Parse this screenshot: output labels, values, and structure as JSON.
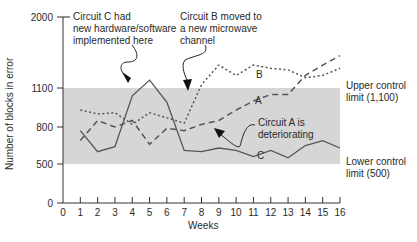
{
  "chart_data": {
    "type": "line",
    "title": "",
    "xlabel": "Weeks",
    "ylabel": "Number of blocks in error",
    "x": [
      1,
      2,
      3,
      4,
      5,
      6,
      7,
      8,
      9,
      10,
      11,
      12,
      13,
      14,
      15,
      16
    ],
    "x_ticks": [
      0,
      1,
      2,
      3,
      4,
      5,
      6,
      7,
      8,
      9,
      10,
      11,
      12,
      13,
      14,
      15,
      16
    ],
    "y_ticks": [
      0,
      500,
      800,
      1100,
      2000
    ],
    "ylim": [
      0,
      2000
    ],
    "xlim": [
      0,
      16
    ],
    "grid": false,
    "series": [
      {
        "name": "C",
        "style": "solid",
        "values": [
          770,
          600,
          640,
          1040,
          1200,
          990,
          610,
          600,
          630,
          610,
          560,
          610,
          550,
          650,
          690,
          630
        ]
      },
      {
        "name": "B",
        "style": "dotted",
        "values": [
          930,
          900,
          910,
          820,
          910,
          870,
          830,
          1140,
          1390,
          1260,
          1390,
          1350,
          1330,
          1230,
          1260,
          1350
        ]
      },
      {
        "name": "A",
        "style": "dashed",
        "values": [
          690,
          850,
          800,
          850,
          660,
          790,
          770,
          820,
          850,
          930,
          1000,
          1050,
          1050,
          1260,
          1390,
          1510
        ]
      }
    ],
    "control_band": {
      "upper": 1100,
      "lower": 500,
      "fill": "#d6d6d6"
    },
    "annotations": [
      {
        "text": "Circuit C had new hardware/software implemented here",
        "arrow_to": {
          "x": 4.6,
          "y": 1130
        }
      },
      {
        "text": "Circuit B moved to a new microwave channel",
        "arrow_to": {
          "x": 7.2,
          "y": 1040
        }
      },
      {
        "text": "Circuit A is deteriorating",
        "arrow_to": {
          "x": 9.0,
          "y": 860
        }
      },
      {
        "text": "Upper control limit (1,100)"
      },
      {
        "text": "Lower control limit (500)"
      }
    ]
  },
  "labels": {
    "ylabel": "Number of blocks in error",
    "xlabel": "Weeks",
    "y_ticks": [
      "2000",
      "1100",
      "800",
      "500",
      "0"
    ],
    "x_ticks": [
      "0",
      "1",
      "2",
      "3",
      "4",
      "5",
      "6",
      "7",
      "8",
      "9",
      "10",
      "11",
      "12",
      "13",
      "14",
      "15",
      "16"
    ],
    "note_c": [
      "Circuit C had",
      "new hardware/software",
      "implemented here"
    ],
    "note_b": [
      "Circuit B moved to",
      "a new microwave",
      "channel"
    ],
    "note_a": [
      "Circuit A is",
      "deteriorating"
    ],
    "ucl": [
      "Upper control",
      "limit (1,100)"
    ],
    "lcl": [
      "Lower control",
      "limit (500)"
    ],
    "series_tag_a": "A",
    "series_tag_b": "B",
    "series_tag_c": "C"
  }
}
